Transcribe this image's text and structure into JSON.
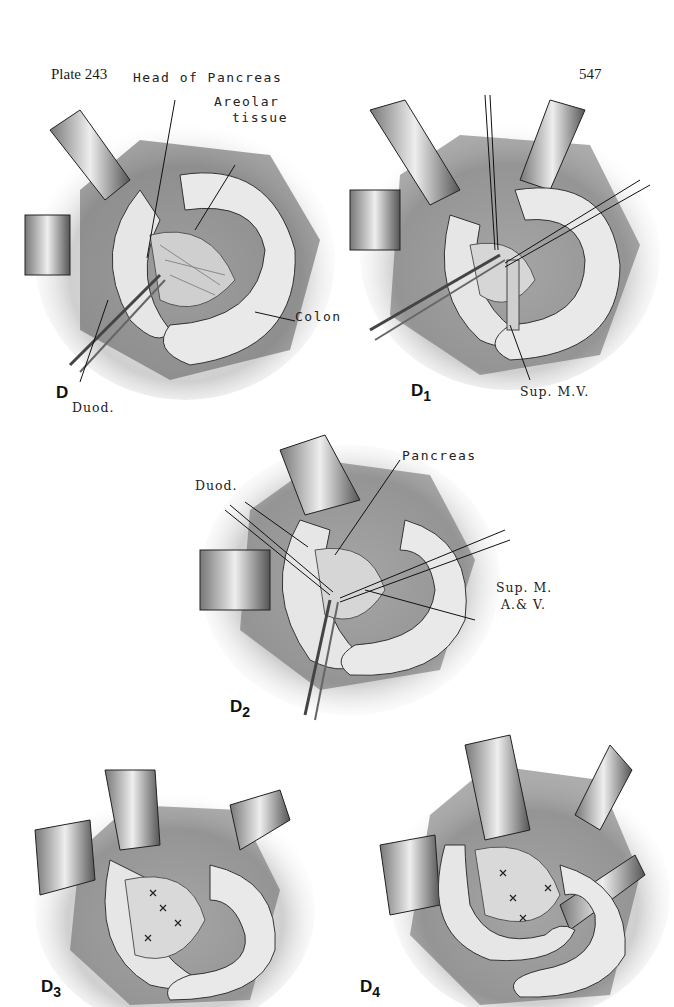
{
  "page": {
    "plate_label": "Plate 243",
    "page_number": "547"
  },
  "figures": [
    {
      "id": "D",
      "label_main": "D",
      "label_sub": "",
      "annotations": [
        "Head of Pancreas",
        "Areolar",
        "tissue",
        "Colon",
        "Duod."
      ]
    },
    {
      "id": "D1",
      "label_main": "D",
      "label_sub": "1",
      "annotations": [
        "Sup. M.V."
      ]
    },
    {
      "id": "D2",
      "label_main": "D",
      "label_sub": "2",
      "annotations": [
        "Pancreas",
        "Duod.",
        "Sup. M.",
        "A.& V."
      ]
    },
    {
      "id": "D3",
      "label_main": "D",
      "label_sub": "3",
      "annotations": []
    },
    {
      "id": "D4",
      "label_main": "D",
      "label_sub": "4",
      "annotations": []
    }
  ],
  "colors": {
    "ink": "#1a1a1a",
    "shade": "#8a8a8a",
    "light": "#d8d8d8",
    "paper": "#ffffff"
  }
}
